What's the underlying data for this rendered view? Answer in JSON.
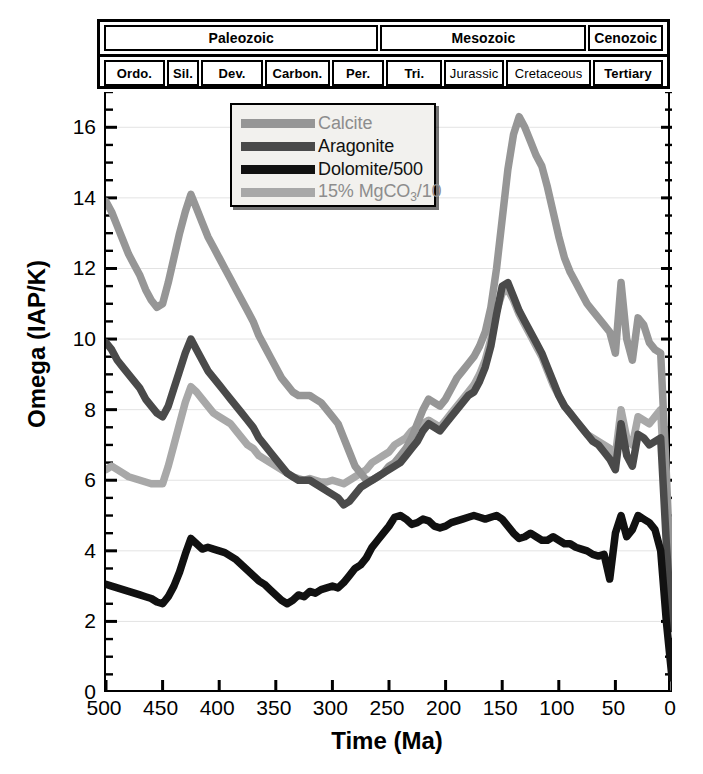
{
  "figure": {
    "title_axis_x": "Time (Ma)",
    "title_axis_y": "Omega (IAP/K)"
  },
  "timescale": {
    "eras": [
      {
        "label": "Paleozoic",
        "start": 500,
        "end": 251
      },
      {
        "label": "Mesozoic",
        "start": 251,
        "end": 65
      },
      {
        "label": "Cenozoic",
        "start": 65,
        "end": 0
      }
    ],
    "periods": [
      {
        "label": "Ordo.",
        "start": 500,
        "end": 444,
        "small": false
      },
      {
        "label": "Sil.",
        "start": 444,
        "end": 416,
        "small": false
      },
      {
        "label": "Dev.",
        "start": 416,
        "end": 359,
        "small": false
      },
      {
        "label": "Carbon.",
        "start": 359,
        "end": 299,
        "small": false
      },
      {
        "label": "Per.",
        "start": 299,
        "end": 251,
        "small": false
      },
      {
        "label": "Tri.",
        "start": 251,
        "end": 200,
        "small": false
      },
      {
        "label": "Jurassic",
        "start": 200,
        "end": 145,
        "small": true
      },
      {
        "label": "Cretaceous",
        "start": 145,
        "end": 65,
        "small": true
      },
      {
        "label": "Tertiary",
        "start": 65,
        "end": 0,
        "small": false
      }
    ]
  },
  "legend": {
    "items": [
      {
        "name": "Calcite",
        "color": "#969696",
        "html": "Calcite"
      },
      {
        "name": "Aragonite",
        "color": "#4a4a4a",
        "html": "Aragonite"
      },
      {
        "name": "Dolomite/500",
        "color": "#111111",
        "html": "Dolomite/500"
      },
      {
        "name": "15% MgCO3/10",
        "color": "#a8a8a8",
        "html": "15% MgCO<sub>3</sub>/10"
      }
    ]
  },
  "chart_data": {
    "type": "line",
    "title": "",
    "xlabel": "Time (Ma)",
    "ylabel": "Omega (IAP/K)",
    "xlim": [
      500,
      0
    ],
    "ylim": [
      0,
      17
    ],
    "x_reversed": true,
    "xticks": [
      500,
      450,
      400,
      350,
      300,
      250,
      200,
      150,
      100,
      50,
      0
    ],
    "yticks": [
      0,
      2,
      4,
      6,
      8,
      10,
      12,
      14,
      16
    ],
    "yticks_minor_step": 0.5,
    "grid": "horizontal-faint",
    "legend_position": "upper-left-inside",
    "series": [
      {
        "name": "Calcite",
        "color": "#969696",
        "x": [
          500,
          495,
          490,
          485,
          480,
          475,
          470,
          465,
          460,
          455,
          450,
          445,
          440,
          435,
          430,
          425,
          420,
          415,
          410,
          405,
          400,
          395,
          390,
          385,
          380,
          375,
          370,
          365,
          360,
          355,
          350,
          345,
          340,
          335,
          330,
          325,
          320,
          315,
          310,
          305,
          300,
          295,
          290,
          285,
          280,
          275,
          270,
          265,
          260,
          255,
          250,
          245,
          240,
          235,
          230,
          225,
          220,
          215,
          210,
          205,
          200,
          195,
          190,
          185,
          180,
          175,
          170,
          165,
          160,
          155,
          150,
          145,
          140,
          135,
          130,
          125,
          120,
          115,
          110,
          105,
          100,
          95,
          90,
          85,
          80,
          75,
          70,
          65,
          60,
          55,
          50,
          45,
          40,
          35,
          30,
          25,
          20,
          15,
          10,
          5,
          0
        ],
        "y": [
          13.9,
          13.6,
          13.2,
          12.8,
          12.4,
          12.1,
          11.8,
          11.4,
          11.1,
          10.9,
          11.0,
          11.6,
          12.3,
          13.0,
          13.6,
          14.1,
          13.7,
          13.3,
          12.9,
          12.6,
          12.3,
          12.0,
          11.7,
          11.4,
          11.1,
          10.8,
          10.5,
          10.1,
          9.8,
          9.5,
          9.2,
          8.9,
          8.7,
          8.5,
          8.4,
          8.4,
          8.4,
          8.3,
          8.2,
          8.0,
          7.8,
          7.6,
          7.2,
          6.8,
          6.4,
          6.2,
          6.0,
          6.0,
          6.1,
          6.2,
          6.4,
          6.5,
          6.7,
          6.9,
          7.2,
          7.6,
          8.0,
          8.3,
          8.2,
          8.1,
          8.3,
          8.6,
          8.9,
          9.1,
          9.3,
          9.5,
          9.8,
          10.2,
          10.9,
          12.0,
          13.4,
          14.8,
          15.8,
          16.3,
          16.0,
          15.6,
          15.2,
          14.9,
          14.3,
          13.6,
          12.9,
          12.3,
          11.9,
          11.6,
          11.3,
          11.0,
          10.8,
          10.6,
          10.4,
          10.2,
          9.6,
          11.6,
          10.0,
          9.4,
          10.6,
          10.4,
          9.9,
          9.7,
          9.6,
          6.2,
          2.4
        ]
      },
      {
        "name": "Aragonite",
        "color": "#4a4a4a",
        "x": [
          500,
          495,
          490,
          485,
          480,
          475,
          470,
          465,
          460,
          455,
          450,
          445,
          440,
          435,
          430,
          425,
          420,
          415,
          410,
          405,
          400,
          395,
          390,
          385,
          380,
          375,
          370,
          365,
          360,
          355,
          350,
          345,
          340,
          335,
          330,
          325,
          320,
          315,
          310,
          305,
          300,
          295,
          290,
          285,
          280,
          275,
          270,
          265,
          260,
          255,
          250,
          245,
          240,
          235,
          230,
          225,
          220,
          215,
          210,
          205,
          200,
          195,
          190,
          185,
          180,
          175,
          170,
          165,
          160,
          155,
          150,
          145,
          140,
          135,
          130,
          125,
          120,
          115,
          110,
          105,
          100,
          95,
          90,
          85,
          80,
          75,
          70,
          65,
          60,
          55,
          50,
          45,
          40,
          35,
          30,
          25,
          20,
          15,
          10,
          5,
          0
        ],
        "y": [
          9.9,
          9.7,
          9.4,
          9.2,
          9.0,
          8.8,
          8.6,
          8.3,
          8.1,
          7.9,
          7.8,
          8.1,
          8.6,
          9.1,
          9.6,
          10.0,
          9.7,
          9.4,
          9.1,
          8.9,
          8.7,
          8.5,
          8.3,
          8.1,
          7.9,
          7.7,
          7.5,
          7.2,
          7.0,
          6.8,
          6.6,
          6.4,
          6.2,
          6.1,
          6.0,
          6.0,
          6.0,
          5.9,
          5.8,
          5.7,
          5.6,
          5.5,
          5.3,
          5.4,
          5.6,
          5.8,
          5.9,
          6.0,
          6.1,
          6.2,
          6.3,
          6.4,
          6.5,
          6.7,
          6.9,
          7.1,
          7.4,
          7.6,
          7.5,
          7.4,
          7.6,
          7.8,
          8.0,
          8.2,
          8.4,
          8.5,
          8.8,
          9.2,
          9.8,
          10.7,
          11.5,
          11.6,
          11.2,
          10.8,
          10.5,
          10.2,
          9.9,
          9.6,
          9.2,
          8.8,
          8.4,
          8.1,
          7.9,
          7.7,
          7.5,
          7.3,
          7.1,
          7.0,
          6.8,
          6.6,
          6.3,
          7.6,
          6.7,
          6.4,
          7.3,
          7.2,
          7.0,
          7.1,
          7.2,
          4.2,
          1.8
        ]
      },
      {
        "name": "Dolomite/500",
        "color": "#111111",
        "x": [
          500,
          495,
          490,
          485,
          480,
          475,
          470,
          465,
          460,
          455,
          450,
          445,
          440,
          435,
          430,
          425,
          420,
          415,
          410,
          405,
          400,
          395,
          390,
          385,
          380,
          375,
          370,
          365,
          360,
          355,
          350,
          345,
          340,
          335,
          330,
          325,
          320,
          315,
          310,
          305,
          300,
          295,
          290,
          285,
          280,
          275,
          270,
          265,
          260,
          255,
          250,
          245,
          240,
          235,
          230,
          225,
          220,
          215,
          210,
          205,
          200,
          195,
          190,
          185,
          180,
          175,
          170,
          165,
          160,
          155,
          150,
          145,
          140,
          135,
          130,
          125,
          120,
          115,
          110,
          105,
          100,
          95,
          90,
          85,
          80,
          75,
          70,
          65,
          60,
          55,
          50,
          45,
          40,
          35,
          30,
          25,
          20,
          15,
          10,
          5,
          0
        ],
        "y": [
          3.05,
          3.0,
          2.95,
          2.9,
          2.85,
          2.8,
          2.75,
          2.7,
          2.65,
          2.55,
          2.5,
          2.7,
          3.0,
          3.4,
          3.9,
          4.35,
          4.2,
          4.05,
          4.1,
          4.05,
          4.0,
          3.95,
          3.85,
          3.75,
          3.6,
          3.45,
          3.3,
          3.15,
          3.05,
          2.9,
          2.75,
          2.6,
          2.5,
          2.6,
          2.75,
          2.7,
          2.85,
          2.8,
          2.9,
          2.95,
          3.0,
          2.95,
          3.1,
          3.3,
          3.5,
          3.6,
          3.8,
          4.1,
          4.3,
          4.5,
          4.7,
          4.95,
          5.0,
          4.9,
          4.75,
          4.8,
          4.9,
          4.85,
          4.7,
          4.65,
          4.7,
          4.8,
          4.85,
          4.9,
          4.95,
          5.0,
          4.95,
          4.9,
          4.95,
          5.0,
          4.9,
          4.7,
          4.5,
          4.35,
          4.4,
          4.5,
          4.4,
          4.3,
          4.3,
          4.4,
          4.3,
          4.2,
          4.2,
          4.1,
          4.05,
          4.0,
          3.9,
          3.85,
          3.9,
          3.2,
          4.5,
          5.0,
          4.4,
          4.6,
          5.0,
          4.9,
          4.8,
          4.6,
          4.0,
          2.0,
          0.4
        ]
      },
      {
        "name": "15% MgCO3/10",
        "color": "#a8a8a8",
        "x": [
          500,
          495,
          490,
          485,
          480,
          475,
          470,
          465,
          460,
          455,
          450,
          445,
          440,
          435,
          430,
          425,
          420,
          415,
          410,
          405,
          400,
          395,
          390,
          385,
          380,
          375,
          370,
          365,
          360,
          355,
          350,
          345,
          340,
          335,
          330,
          325,
          320,
          315,
          310,
          305,
          300,
          295,
          290,
          285,
          280,
          275,
          270,
          265,
          260,
          255,
          250,
          245,
          240,
          235,
          230,
          225,
          220,
          215,
          210,
          205,
          200,
          195,
          190,
          185,
          180,
          175,
          170,
          165,
          160,
          155,
          150,
          145,
          140,
          135,
          130,
          125,
          120,
          115,
          110,
          105,
          100,
          95,
          90,
          85,
          80,
          75,
          70,
          65,
          60,
          55,
          50,
          45,
          40,
          35,
          30,
          25,
          20,
          15,
          10,
          5,
          0
        ],
        "y": [
          6.3,
          6.4,
          6.3,
          6.2,
          6.1,
          6.05,
          6.0,
          5.95,
          5.9,
          5.9,
          5.9,
          6.4,
          7.0,
          7.6,
          8.2,
          8.65,
          8.5,
          8.3,
          8.1,
          7.9,
          7.8,
          7.7,
          7.6,
          7.4,
          7.2,
          7.0,
          6.9,
          6.7,
          6.6,
          6.5,
          6.4,
          6.3,
          6.2,
          6.1,
          6.05,
          6.0,
          6.05,
          6.0,
          5.95,
          5.95,
          6.0,
          5.95,
          5.9,
          6.0,
          6.1,
          6.2,
          6.3,
          6.5,
          6.6,
          6.7,
          6.8,
          7.0,
          7.1,
          7.2,
          7.4,
          7.5,
          7.6,
          7.7,
          7.6,
          7.5,
          7.7,
          7.9,
          8.1,
          8.3,
          8.5,
          8.7,
          9.0,
          9.4,
          10.0,
          10.8,
          11.3,
          11.4,
          11.1,
          10.7,
          10.4,
          10.1,
          9.8,
          9.5,
          9.1,
          8.7,
          8.4,
          8.1,
          7.9,
          7.7,
          7.5,
          7.3,
          7.2,
          7.1,
          7.0,
          6.9,
          6.7,
          8.0,
          7.2,
          7.0,
          7.8,
          7.7,
          7.6,
          7.8,
          8.0,
          5.0,
          2.2
        ]
      }
    ]
  },
  "axes": {
    "xticklabels": [
      "500",
      "450",
      "400",
      "350",
      "300",
      "250",
      "200",
      "150",
      "100",
      "50",
      "0"
    ],
    "yticklabels": [
      "0",
      "2",
      "4",
      "6",
      "8",
      "10",
      "12",
      "14",
      "16"
    ]
  }
}
